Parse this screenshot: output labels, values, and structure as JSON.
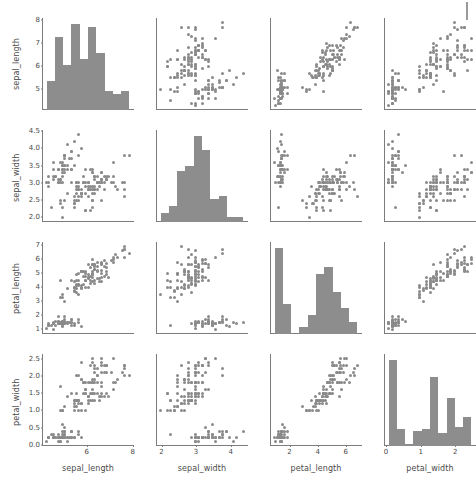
{
  "chart_data": {
    "type": "scatter",
    "title": "",
    "subtitle": "",
    "chart_kind": "pairplot-scatter-plot-matrix",
    "grid": false,
    "legend": "none",
    "point_color": "#8a8a8a",
    "bar_color": "#8d8d8d",
    "axis_color": "#7c7c7c",
    "background": "#ffffff",
    "n_points": 150,
    "variables": [
      "sepal_length",
      "sepal_width",
      "petal_length",
      "petal_width"
    ],
    "axis_ranges": {
      "sepal_length": [
        4.3,
        7.9
      ],
      "sepal_width": [
        2.0,
        4.4
      ],
      "petal_length": [
        1.0,
        6.9
      ],
      "petal_width": [
        0.1,
        2.5
      ]
    },
    "ticks": {
      "sepal_length": [
        5,
        6,
        7,
        8
      ],
      "sepal_length_x": [
        6,
        8
      ],
      "sepal_width": [
        2.0,
        2.5,
        3.0,
        3.5,
        4.0,
        4.5
      ],
      "sepal_width_x": [
        2,
        3,
        4
      ],
      "petal_length": [
        1,
        2,
        3,
        4,
        5,
        6,
        7
      ],
      "petal_length_x": [
        2,
        4,
        6
      ],
      "petal_width": [
        0.0,
        0.5,
        1.0,
        1.5,
        2.0,
        2.5
      ],
      "petal_width_x": [
        0,
        1,
        2
      ]
    },
    "tick_labels": {
      "sepal_length": [
        "5",
        "6",
        "7",
        "8"
      ],
      "sepal_length_x": [
        "6",
        "8"
      ],
      "sepal_width": [
        "2.0",
        "2.5",
        "3.0",
        "3.5",
        "4.0",
        "4.5"
      ],
      "sepal_width_x": [
        "2",
        "3",
        "4"
      ],
      "petal_length": [
        "1",
        "2",
        "3",
        "4",
        "5",
        "6",
        "7"
      ],
      "petal_length_x": [
        "2",
        "4",
        "6"
      ],
      "petal_width": [
        "0.0",
        "0.5",
        "1.0",
        "1.5",
        "2.0",
        "2.5"
      ],
      "petal_width_x": [
        "0",
        "1",
        "2"
      ]
    },
    "histograms": {
      "sepal_length": {
        "bin_edges": [
          4.3,
          4.66,
          5.02,
          5.38,
          5.74,
          6.1,
          6.46,
          6.82,
          7.18,
          7.54,
          7.9
        ],
        "counts": [
          9,
          23,
          14,
          27,
          16,
          26,
          18,
          6,
          5,
          6
        ]
      },
      "sepal_width": {
        "bin_edges": [
          2.0,
          2.24,
          2.48,
          2.72,
          2.96,
          3.2,
          3.44,
          3.68,
          3.92,
          4.16,
          4.4
        ],
        "counts": [
          4,
          7,
          22,
          24,
          37,
          31,
          10,
          11,
          2,
          2
        ]
      },
      "petal_length": {
        "bin_edges": [
          1.0,
          1.59,
          2.18,
          2.77,
          3.36,
          3.95,
          4.54,
          5.13,
          5.72,
          6.31,
          6.9
        ],
        "counts": [
          37,
          13,
          0,
          3,
          8,
          26,
          29,
          18,
          11,
          5
        ]
      },
      "petal_width": {
        "bin_edges": [
          0.1,
          0.34,
          0.58,
          0.82,
          1.06,
          1.3,
          1.54,
          1.78,
          2.02,
          2.26,
          2.5
        ],
        "counts": [
          41,
          8,
          1,
          7,
          8,
          33,
          6,
          23,
          9,
          14
        ]
      }
    },
    "axis_titles": {
      "x": [
        "sepal_length",
        "sepal_width",
        "petal_length",
        "petal_width"
      ],
      "y": [
        "sepal_length",
        "sepal_width",
        "petal_length",
        "petal_width"
      ]
    },
    "points": {
      "sepal_length": [
        5.1,
        4.9,
        4.7,
        4.6,
        5.0,
        5.4,
        4.6,
        5.0,
        4.4,
        4.9,
        5.4,
        4.8,
        4.8,
        4.3,
        5.8,
        5.7,
        5.4,
        5.1,
        5.7,
        5.1,
        5.4,
        5.1,
        4.6,
        5.1,
        4.8,
        5.0,
        5.0,
        5.2,
        5.2,
        4.7,
        4.8,
        5.4,
        5.2,
        5.5,
        4.9,
        5.0,
        5.5,
        4.9,
        4.4,
        5.1,
        5.0,
        4.5,
        4.4,
        5.0,
        5.1,
        4.8,
        5.1,
        4.6,
        5.3,
        5.0,
        7.0,
        6.4,
        6.9,
        5.5,
        6.5,
        5.7,
        6.3,
        4.9,
        6.6,
        5.2,
        5.0,
        5.9,
        6.0,
        6.1,
        5.6,
        6.7,
        5.6,
        5.8,
        6.2,
        5.6,
        5.9,
        6.1,
        6.3,
        6.1,
        6.4,
        6.6,
        6.8,
        6.7,
        6.0,
        5.7,
        5.5,
        5.5,
        5.8,
        6.0,
        5.4,
        6.0,
        6.7,
        6.3,
        5.6,
        5.5,
        5.5,
        6.1,
        5.8,
        5.0,
        5.6,
        5.7,
        5.7,
        6.2,
        5.1,
        5.7,
        6.3,
        5.8,
        7.1,
        6.3,
        6.5,
        7.6,
        4.9,
        7.3,
        6.7,
        7.2,
        6.5,
        6.4,
        6.8,
        5.7,
        5.8,
        6.4,
        6.5,
        7.7,
        7.7,
        6.0,
        6.9,
        5.6,
        7.7,
        6.3,
        6.7,
        7.2,
        6.2,
        6.1,
        6.4,
        7.2,
        7.4,
        7.9,
        6.4,
        6.3,
        6.1,
        7.7,
        6.3,
        6.4,
        6.0,
        6.9,
        6.7,
        6.9,
        5.8,
        6.8,
        6.7,
        6.7,
        6.3,
        6.5,
        6.2,
        5.9
      ],
      "sepal_width": [
        3.5,
        3.0,
        3.2,
        3.1,
        3.6,
        3.9,
        3.4,
        3.4,
        2.9,
        3.1,
        3.7,
        3.4,
        3.0,
        3.0,
        4.0,
        4.4,
        3.9,
        3.5,
        3.8,
        3.8,
        3.4,
        3.7,
        3.6,
        3.3,
        3.4,
        3.0,
        3.4,
        3.5,
        3.4,
        3.2,
        3.1,
        3.4,
        4.1,
        4.2,
        3.1,
        3.2,
        3.5,
        3.6,
        3.0,
        3.4,
        3.5,
        2.3,
        3.2,
        3.5,
        3.8,
        3.0,
        3.8,
        3.2,
        3.7,
        3.3,
        3.2,
        3.2,
        3.1,
        2.3,
        2.8,
        2.8,
        3.3,
        2.4,
        2.9,
        2.7,
        2.0,
        3.0,
        2.2,
        2.9,
        2.9,
        3.1,
        3.0,
        2.7,
        2.2,
        2.5,
        3.2,
        2.8,
        2.5,
        2.8,
        2.9,
        3.0,
        2.8,
        3.0,
        2.9,
        2.6,
        2.4,
        2.4,
        2.7,
        2.7,
        3.0,
        3.4,
        3.1,
        2.3,
        3.0,
        2.5,
        2.6,
        3.0,
        2.6,
        2.3,
        2.7,
        3.0,
        2.9,
        2.9,
        2.5,
        2.8,
        3.3,
        2.7,
        3.0,
        2.9,
        3.0,
        3.0,
        2.5,
        2.9,
        2.5,
        3.6,
        3.2,
        2.7,
        3.0,
        2.5,
        2.8,
        3.2,
        3.0,
        3.8,
        2.6,
        2.2,
        3.2,
        2.8,
        2.8,
        2.7,
        3.3,
        3.2,
        2.8,
        3.0,
        2.8,
        3.0,
        2.8,
        3.8,
        2.8,
        2.8,
        2.6,
        3.0,
        3.4,
        3.1,
        3.0,
        3.1,
        3.1,
        3.1,
        2.7,
        3.2,
        3.3,
        3.0,
        2.5,
        3.0,
        3.4,
        3.0
      ],
      "petal_length": [
        1.4,
        1.4,
        1.3,
        1.5,
        1.4,
        1.7,
        1.4,
        1.5,
        1.4,
        1.5,
        1.5,
        1.6,
        1.4,
        1.1,
        1.2,
        1.5,
        1.3,
        1.4,
        1.7,
        1.5,
        1.7,
        1.5,
        1.0,
        1.7,
        1.9,
        1.6,
        1.6,
        1.5,
        1.4,
        1.6,
        1.6,
        1.5,
        1.5,
        1.4,
        1.5,
        1.2,
        1.3,
        1.4,
        1.3,
        1.5,
        1.3,
        1.3,
        1.3,
        1.6,
        1.9,
        1.4,
        1.6,
        1.4,
        1.5,
        1.4,
        4.7,
        4.5,
        4.9,
        4.0,
        4.6,
        4.5,
        4.7,
        3.3,
        4.6,
        3.9,
        3.5,
        4.2,
        4.0,
        4.7,
        3.6,
        4.4,
        4.5,
        4.1,
        4.5,
        3.9,
        4.8,
        4.0,
        4.9,
        4.7,
        4.3,
        4.4,
        4.8,
        5.0,
        4.5,
        3.5,
        3.8,
        3.7,
        3.9,
        5.1,
        4.5,
        4.5,
        4.7,
        4.4,
        4.1,
        4.0,
        4.4,
        4.6,
        4.0,
        3.3,
        4.2,
        4.2,
        4.2,
        4.3,
        3.0,
        4.1,
        6.0,
        5.1,
        5.9,
        5.6,
        5.8,
        6.6,
        4.5,
        6.3,
        5.8,
        6.1,
        5.1,
        5.3,
        5.5,
        5.0,
        5.1,
        5.3,
        5.5,
        6.7,
        6.9,
        5.0,
        5.7,
        4.9,
        6.7,
        4.9,
        5.7,
        6.0,
        4.8,
        4.9,
        5.6,
        5.8,
        6.1,
        6.4,
        5.6,
        5.1,
        5.6,
        6.1,
        5.6,
        5.5,
        4.8,
        5.4,
        5.6,
        5.1,
        5.1,
        5.9,
        5.7,
        5.2,
        5.0,
        5.2,
        5.4,
        5.1
      ],
      "petal_width": [
        0.2,
        0.2,
        0.2,
        0.2,
        0.2,
        0.4,
        0.3,
        0.2,
        0.2,
        0.1,
        0.2,
        0.2,
        0.1,
        0.1,
        0.2,
        0.4,
        0.4,
        0.3,
        0.3,
        0.3,
        0.2,
        0.4,
        0.2,
        0.5,
        0.2,
        0.2,
        0.4,
        0.2,
        0.2,
        0.2,
        0.2,
        0.4,
        0.1,
        0.2,
        0.2,
        0.2,
        0.2,
        0.1,
        0.2,
        0.2,
        0.3,
        0.3,
        0.2,
        0.6,
        0.4,
        0.3,
        0.2,
        0.2,
        0.2,
        0.2,
        1.4,
        1.5,
        1.5,
        1.3,
        1.5,
        1.3,
        1.6,
        1.0,
        1.3,
        1.4,
        1.0,
        1.5,
        1.0,
        1.4,
        1.3,
        1.4,
        1.5,
        1.0,
        1.5,
        1.1,
        1.8,
        1.3,
        1.5,
        1.2,
        1.3,
        1.4,
        1.4,
        1.7,
        1.5,
        1.0,
        1.1,
        1.0,
        1.2,
        1.6,
        1.5,
        1.6,
        1.5,
        1.3,
        1.3,
        1.3,
        1.2,
        1.4,
        1.2,
        1.0,
        1.3,
        1.2,
        1.3,
        1.3,
        1.1,
        1.3,
        2.5,
        1.9,
        2.1,
        1.8,
        2.2,
        2.1,
        1.7,
        1.8,
        1.8,
        2.5,
        2.0,
        1.9,
        2.1,
        2.0,
        2.4,
        2.3,
        1.8,
        2.2,
        2.3,
        1.5,
        2.3,
        2.0,
        2.0,
        1.8,
        2.1,
        1.8,
        1.8,
        1.8,
        2.1,
        1.6,
        1.9,
        2.0,
        2.2,
        1.5,
        1.4,
        2.3,
        2.4,
        1.8,
        1.8,
        2.1,
        2.4,
        2.3,
        1.9,
        2.3,
        2.5,
        2.3,
        1.9,
        2.0,
        2.3,
        1.8
      ]
    }
  }
}
